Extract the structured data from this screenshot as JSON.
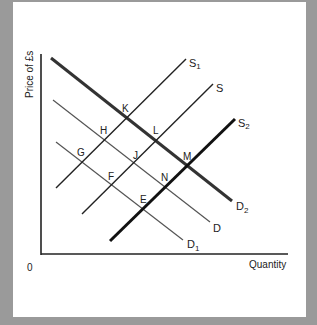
{
  "diagram": {
    "y_axis_label": "Price of £s",
    "x_axis_label": "Quantity",
    "origin_label": "0",
    "curves": [
      {
        "id": "D2",
        "label": "D",
        "sub": "2",
        "kind": "demand",
        "weight": "thick"
      },
      {
        "id": "D",
        "label": "D",
        "sub": "",
        "kind": "demand",
        "weight": "thin"
      },
      {
        "id": "D1",
        "label": "D",
        "sub": "1",
        "kind": "demand",
        "weight": "thin"
      },
      {
        "id": "S1",
        "label": "S",
        "sub": "1",
        "kind": "supply",
        "weight": "medium"
      },
      {
        "id": "S",
        "label": "S",
        "sub": "",
        "kind": "supply",
        "weight": "medium"
      },
      {
        "id": "S2",
        "label": "S",
        "sub": "2",
        "kind": "supply",
        "weight": "thick"
      }
    ],
    "points": {
      "K": "K",
      "H": "H",
      "L": "L",
      "G": "G",
      "J": "J",
      "M": "M",
      "F": "F",
      "N": "N",
      "E": "E"
    },
    "colors": {
      "frame": "#9a9a9a",
      "panel": "#ffffff",
      "line": "#222222",
      "thin_line": "#444444"
    }
  }
}
